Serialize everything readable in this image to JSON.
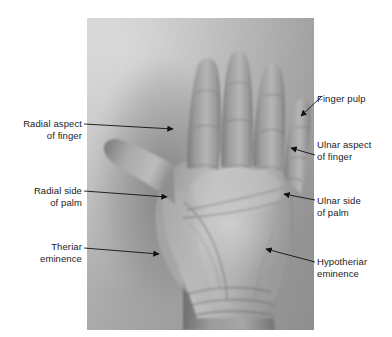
{
  "figure": {
    "kind": "labelled-photograph",
    "background_color": "#ffffff",
    "photo_tone": "grayscale"
  },
  "labels": {
    "left": [
      {
        "id": "radial-aspect-of-finger",
        "line1": "Radial aspect",
        "line2": "of finger",
        "text": "Radial aspect\nof finger"
      },
      {
        "id": "radial-side-of-palm",
        "line1": "Radial side",
        "line2": "of palm",
        "text": "Radial side\nof palm"
      },
      {
        "id": "theriar-eminence",
        "line1": "Theriar",
        "line2": "eminence",
        "text": "Theriar\neminence"
      }
    ],
    "right": [
      {
        "id": "finger-pulp",
        "line1": "Finger pulp",
        "line2": "",
        "text": "Finger pulp"
      },
      {
        "id": "ulnar-aspect-of-finger",
        "line1": "Ulnar aspect",
        "line2": "of finger",
        "text": "Ulnar aspect\nof finger"
      },
      {
        "id": "ulnar-side-of-palm",
        "line1": "Ulnar side",
        "line2": "of palm",
        "text": "Ulnar side\nof palm"
      },
      {
        "id": "hypotheriar-eminence",
        "line1": "Hypotheriar",
        "line2": "eminence",
        "text": "Hypotheriar\neminence"
      }
    ]
  },
  "leaders": {
    "stroke_color": "#111111",
    "stroke_width": 0.9,
    "items": [
      {
        "id": "leader-radial-aspect-of-finger",
        "from": [
          84,
          124
        ],
        "to": [
          176,
          129
        ],
        "arrow": "right"
      },
      {
        "id": "leader-radial-side-of-palm",
        "from": [
          84,
          191
        ],
        "to": [
          170,
          197
        ],
        "arrow": "right"
      },
      {
        "id": "leader-theriar-eminence",
        "from": [
          84,
          248
        ],
        "to": [
          162,
          254
        ],
        "arrow": "right"
      },
      {
        "id": "leader-finger-pulp",
        "from": [
          322,
          96
        ],
        "to": [
          299,
          118
        ],
        "arrow": "down-left"
      },
      {
        "id": "leader-ulnar-aspect-of-finger",
        "from": [
          315,
          155
        ],
        "to": [
          288,
          147
        ],
        "arrow": "left"
      },
      {
        "id": "leader-ulnar-side-of-palm",
        "from": [
          315,
          200
        ],
        "to": [
          281,
          193
        ],
        "arrow": "left"
      },
      {
        "id": "leader-hypotheriar-eminence",
        "from": [
          315,
          262
        ],
        "to": [
          263,
          248
        ],
        "arrow": "left"
      }
    ]
  },
  "photo_frame": {
    "left": 87,
    "top": 18,
    "width": 227,
    "height": 312
  }
}
